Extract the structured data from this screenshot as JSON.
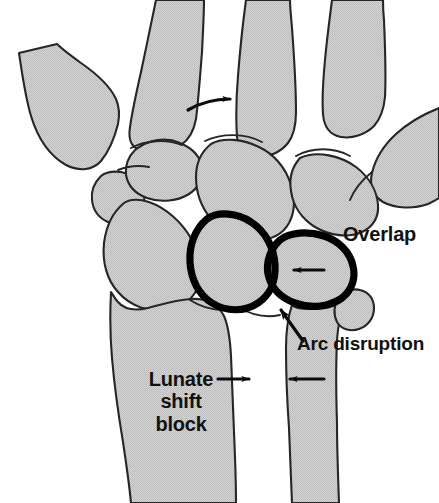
{
  "figure": {
    "view": "posteroanterior wrist radiograph schematic",
    "background_color": "#ffffff",
    "bone_fill_color": "#cccccc",
    "bone_outline_color": "#1a1a1a",
    "highlight_outline_color": "#000000",
    "label_color": "#111111"
  },
  "labels": {
    "overlap": "Overlap",
    "arc_disruption": "Arc disruption",
    "lunate_shift_block": {
      "line1": "Lunate",
      "line2": "shift",
      "line3": "block"
    }
  },
  "annotations": [
    {
      "name": "overlap-label",
      "text": "Overlap",
      "x": 343,
      "y": 224,
      "points_to": "capitate-triquetrum-overlap-region"
    },
    {
      "name": "arc-disruption-label",
      "text": "Arc disruption",
      "x": 297,
      "y": 334,
      "points_to": "disrupted-gilula-arc"
    },
    {
      "name": "lunate-shift-block-label",
      "text": "Lunate shift block",
      "x": 138,
      "y": 368,
      "points_to": "distal-radioulnar-gap"
    }
  ],
  "arrows": [
    {
      "name": "metacarpal-rotation-arrow",
      "direction": "curved-right",
      "from_x": 190,
      "from_y": 108,
      "to_x": 236,
      "to_y": 99
    },
    {
      "name": "overlap-shift-arrow",
      "direction": "left",
      "from_x": 323,
      "from_y": 270,
      "to_x": 289,
      "to_y": 270
    },
    {
      "name": "arc-disruption-pointer-arrow",
      "direction": "up-left",
      "from_x": 300,
      "from_y": 336,
      "to_x": 276,
      "to_y": 303
    },
    {
      "name": "lunate-block-right-arrow",
      "direction": "right",
      "from_x": 218,
      "from_y": 379,
      "to_x": 254,
      "to_y": 379
    },
    {
      "name": "lunate-block-left-arrow",
      "direction": "left",
      "from_x": 323,
      "from_y": 379,
      "to_x": 285,
      "to_y": 379
    }
  ],
  "bones": [
    {
      "name": "first-metacarpal-base",
      "region": "upper-left",
      "highlighted": false
    },
    {
      "name": "second-metacarpal",
      "region": "top",
      "highlighted": false
    },
    {
      "name": "third-metacarpal",
      "region": "top-center",
      "highlighted": false
    },
    {
      "name": "fourth-metacarpal",
      "region": "top-right",
      "highlighted": false
    },
    {
      "name": "fifth-metacarpal",
      "region": "right",
      "highlighted": false
    },
    {
      "name": "trapezium",
      "region": "left-mid",
      "highlighted": false
    },
    {
      "name": "trapezoid",
      "region": "center-upper",
      "highlighted": false
    },
    {
      "name": "capitate",
      "region": "center",
      "highlighted": false
    },
    {
      "name": "hamate",
      "region": "center-right",
      "highlighted": false
    },
    {
      "name": "scaphoid",
      "region": "left-center",
      "highlighted": false
    },
    {
      "name": "lunate",
      "region": "center-lower",
      "highlighted": true
    },
    {
      "name": "triquetrum",
      "region": "right-lower",
      "highlighted": true
    },
    {
      "name": "radius",
      "region": "bottom-left",
      "highlighted": false
    },
    {
      "name": "ulna",
      "region": "bottom-right",
      "highlighted": false
    }
  ]
}
